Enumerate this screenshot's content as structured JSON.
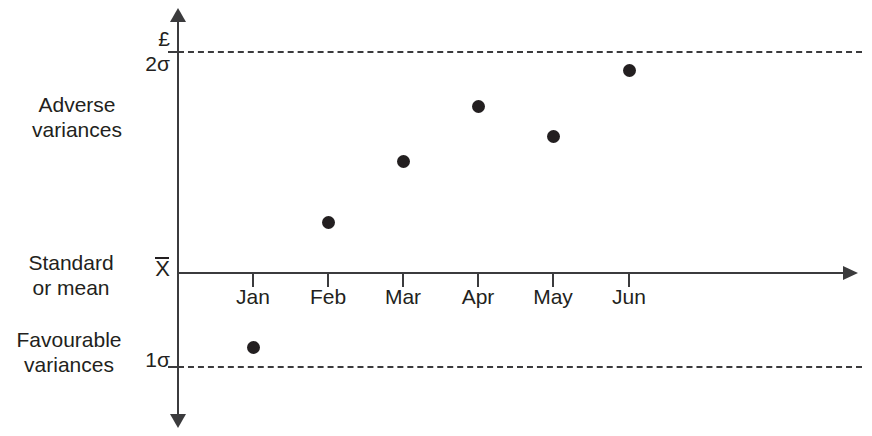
{
  "chart_data": {
    "type": "scatter",
    "title": "",
    "subtitle": "",
    "xlabel": "",
    "ylabel": "£",
    "categories": [
      "Jan",
      "Feb",
      "Mar",
      "Apr",
      "May",
      "Jun"
    ],
    "series": [
      {
        "name": "Variance",
        "values": [
          -0.85,
          0.54,
          1.19,
          1.77,
          1.46,
          2.15
        ]
      }
    ],
    "ylim": [
      -1.35,
      2.8
    ],
    "grid": false,
    "legend_position": "none",
    "reference_lines": [
      {
        "label": "2σ",
        "note": "upper control limit",
        "style": "dashed",
        "value": 2.35
      },
      {
        "label": "X̄",
        "note": "standard or mean",
        "style": "solid",
        "value": 0
      },
      {
        "label": "1σ",
        "note": "lower control limit",
        "style": "dashed",
        "value": -1.05
      }
    ],
    "annotations": [
      {
        "text": "Adverse variances",
        "region": "above mean"
      },
      {
        "text": "Standard or mean",
        "region": "mean line"
      },
      {
        "text": "Favourable variances",
        "region": "below mean"
      }
    ],
    "points_px": [
      {
        "category": "Jan",
        "x": 253,
        "y": 347
      },
      {
        "category": "Feb",
        "x": 328,
        "y": 222
      },
      {
        "category": "Mar",
        "x": 403,
        "y": 161
      },
      {
        "category": "Apr",
        "x": 478,
        "y": 106
      },
      {
        "category": "May",
        "x": 553,
        "y": 136
      },
      {
        "category": "Jun",
        "x": 629,
        "y": 70
      }
    ]
  },
  "axes": {
    "currency_symbol": "£",
    "upper_limit_label": "2σ",
    "mean_label": "X",
    "lower_limit_label": "1σ",
    "tick_labels": [
      "Jan",
      "Feb",
      "Mar",
      "Apr",
      "May",
      "Jun"
    ]
  },
  "annotations": {
    "adverse": {
      "line1": "Adverse",
      "line2": "variances"
    },
    "standard": {
      "line1": "Standard",
      "line2": "or mean"
    },
    "favourable": {
      "line1": "Favourable",
      "line2": "variances"
    }
  },
  "colors": {
    "ink": "#231f20",
    "axis": "#3b3b3d",
    "background": "#ffffff"
  }
}
